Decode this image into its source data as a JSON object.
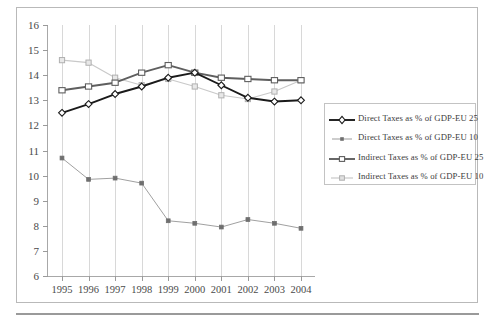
{
  "chart_data": {
    "type": "line",
    "title": "",
    "xlabel": "",
    "ylabel": "",
    "categories": [
      "1995",
      "1996",
      "1997",
      "1998",
      "1999",
      "2000",
      "2001",
      "2002",
      "2003",
      "2004"
    ],
    "x": [
      1995,
      1996,
      1997,
      1998,
      1999,
      2000,
      2001,
      2002,
      2003,
      2004
    ],
    "ylim": [
      6,
      16
    ],
    "ytick_labels": [
      "6",
      "7",
      "8",
      "9",
      "10",
      "11",
      "12",
      "13",
      "14",
      "15",
      "16"
    ],
    "yticks": [
      6,
      7,
      8,
      9,
      10,
      11,
      12,
      13,
      14,
      15,
      16
    ],
    "grid": "vertical",
    "legend_position": "right",
    "series": [
      {
        "name": "Direct Taxes as % of GDP-EU 25",
        "marker": "diamond-open",
        "color": "#1a1a1a",
        "values": [
          12.5,
          12.85,
          13.25,
          13.55,
          13.9,
          14.1,
          13.6,
          13.1,
          12.95,
          13.0
        ]
      },
      {
        "name": "Direct Taxes as % of GDP-EU 10",
        "marker": "square-small",
        "color": "#8a8a8a",
        "values": [
          10.7,
          9.85,
          9.9,
          9.7,
          8.2,
          8.1,
          7.95,
          8.25,
          8.1,
          7.9
        ]
      },
      {
        "name": "Indirect Taxes as % of GDP-EU 25",
        "marker": "triangle-open",
        "color": "#6e6e6e",
        "values": [
          13.4,
          13.55,
          13.7,
          14.1,
          14.4,
          14.1,
          13.9,
          13.85,
          13.8,
          13.8
        ]
      },
      {
        "name": "Indirect Taxes as % of GDP-EU 10",
        "marker": "square-open-light",
        "color": "#bdbdbd",
        "values": [
          14.6,
          14.5,
          13.9,
          13.6,
          13.85,
          13.55,
          13.2,
          13.05,
          13.35,
          13.8
        ]
      }
    ]
  },
  "legend": {
    "items": [
      {
        "label": "Direct Taxes as % of GDP-EU 25"
      },
      {
        "label": "Direct Taxes as % of GDP-EU 10"
      },
      {
        "label": "Indirect Taxes as % of GDP-EU 25"
      },
      {
        "label": "Indirect Taxes as % of GDP-EU 10"
      }
    ]
  },
  "colors": {
    "direct_eu25": "#1a1a1a",
    "direct_eu10": "#8a8a8a",
    "indirect_eu25": "#6e6e6e",
    "indirect_eu10": "#bdbdbd",
    "frame": "#b9b9b9",
    "axis": "#a8a8a8",
    "gridline": "#d8d8d8",
    "text": "#4a4a4a"
  }
}
